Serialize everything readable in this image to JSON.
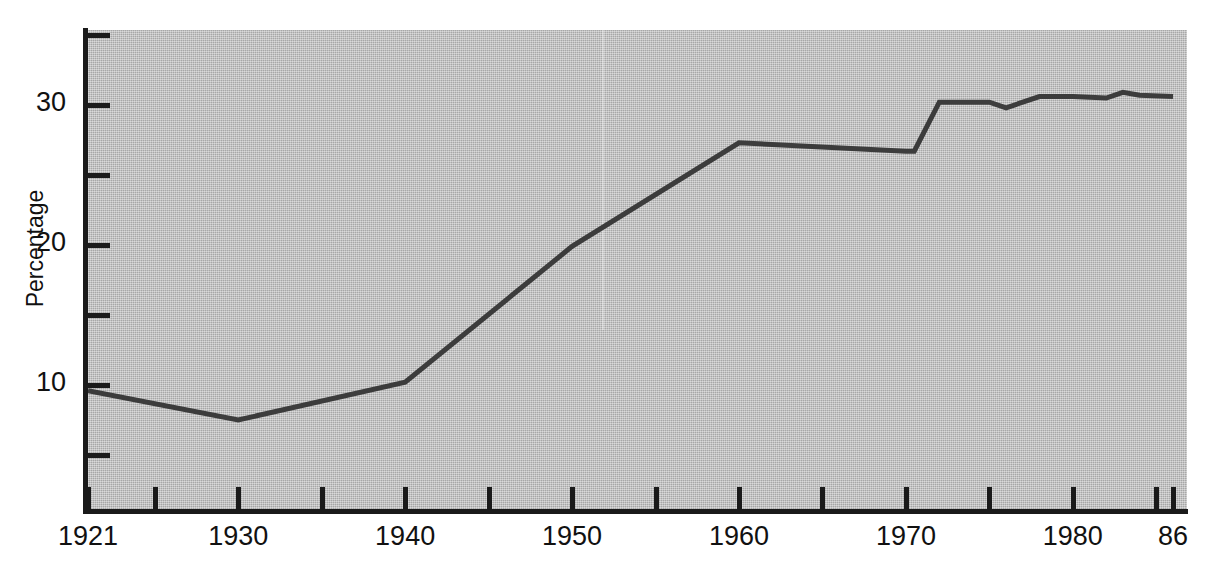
{
  "chart_data": {
    "type": "line",
    "title": "",
    "subtitle": "",
    "xlabel": "",
    "ylabel": "Percentage",
    "xlim": [
      1921,
      1986
    ],
    "ylim": [
      3.4,
      37.5
    ],
    "grid": false,
    "legend": null,
    "annotations": [],
    "x_tick_labels": [
      "1921",
      "1930",
      "1940",
      "1950",
      "1960",
      "1970",
      "1980",
      "86"
    ],
    "x_tick_values": [
      1921,
      1930,
      1940,
      1950,
      1960,
      1970,
      1980,
      1986
    ],
    "x_minor_tick_values": [
      1925,
      1935,
      1945,
      1955,
      1965,
      1975,
      1985
    ],
    "y_tick_labels": [
      "",
      "30",
      "",
      "20",
      "",
      "10",
      ""
    ],
    "y_tick_values": [
      35,
      30,
      25,
      20,
      15,
      10,
      5
    ],
    "y_labelled_ticks": [
      {
        "value": 30,
        "label": "30"
      },
      {
        "value": 20,
        "label": "20"
      },
      {
        "value": 10,
        "label": "10"
      }
    ],
    "series": [
      {
        "name": "Percentage",
        "color": "#3c3c3c",
        "x": [
          1921,
          1930,
          1940,
          1950,
          1960,
          1970,
          1970.5,
          1972,
          1975,
          1976,
          1978,
          1980,
          1982,
          1983,
          1984,
          1986
        ],
        "values": [
          9.6,
          7.5,
          10.2,
          19.9,
          27.3,
          26.7,
          26.7,
          30.2,
          30.2,
          29.8,
          30.6,
          30.6,
          30.5,
          30.9,
          30.7,
          30.6
        ]
      }
    ]
  },
  "axes": {
    "y_title": "Percentage",
    "y_labels": [
      "30",
      "20",
      "10"
    ],
    "x_labels": [
      "1921",
      "1930",
      "1940",
      "1950",
      "1960",
      "1970",
      "1980",
      "86"
    ]
  },
  "style": {
    "plot_background": "#b9b9b9",
    "axis_color": "#1a1a1a",
    "line_color": "#3c3c3c",
    "text_color": "#111111",
    "page_background": "#ffffff"
  }
}
